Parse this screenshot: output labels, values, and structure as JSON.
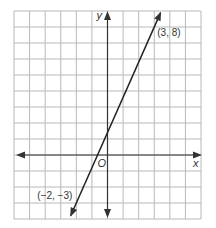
{
  "chart_data": {
    "type": "line",
    "title": "",
    "xlabel": "x",
    "ylabel": "y",
    "origin_label": "O",
    "xlim": [
      -6,
      6
    ],
    "ylim": [
      -4,
      9
    ],
    "grid": true,
    "grid_step": 1,
    "tick_labels": false,
    "series": [
      {
        "name": "line through (-2, -3) and (3, 8)",
        "points": [
          {
            "x": -2,
            "y": -3,
            "label": "(−2, −3)"
          },
          {
            "x": 3,
            "y": 8,
            "label": "(3, 8)"
          }
        ],
        "slope": 2.2,
        "y_intercept": 1.4,
        "extends_both_directions": true
      }
    ]
  },
  "colors": {
    "grid": "#b8b8b8",
    "axis": "#333333",
    "line": "#222222",
    "background": "#ffffff"
  }
}
